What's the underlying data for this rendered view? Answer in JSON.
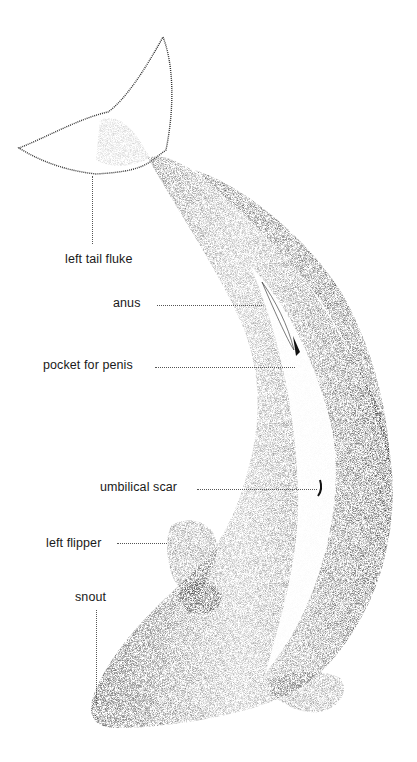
{
  "diagram": {
    "labels": [
      {
        "id": "left_tail_fluke",
        "text": "left tail fluke"
      },
      {
        "id": "anus",
        "text": "anus"
      },
      {
        "id": "pocket_for_penis",
        "text": "pocket for penis"
      },
      {
        "id": "umbilical_scar",
        "text": "umbilical scar"
      },
      {
        "id": "left_flipper",
        "text": "left flipper"
      },
      {
        "id": "snout",
        "text": "snout"
      }
    ]
  }
}
